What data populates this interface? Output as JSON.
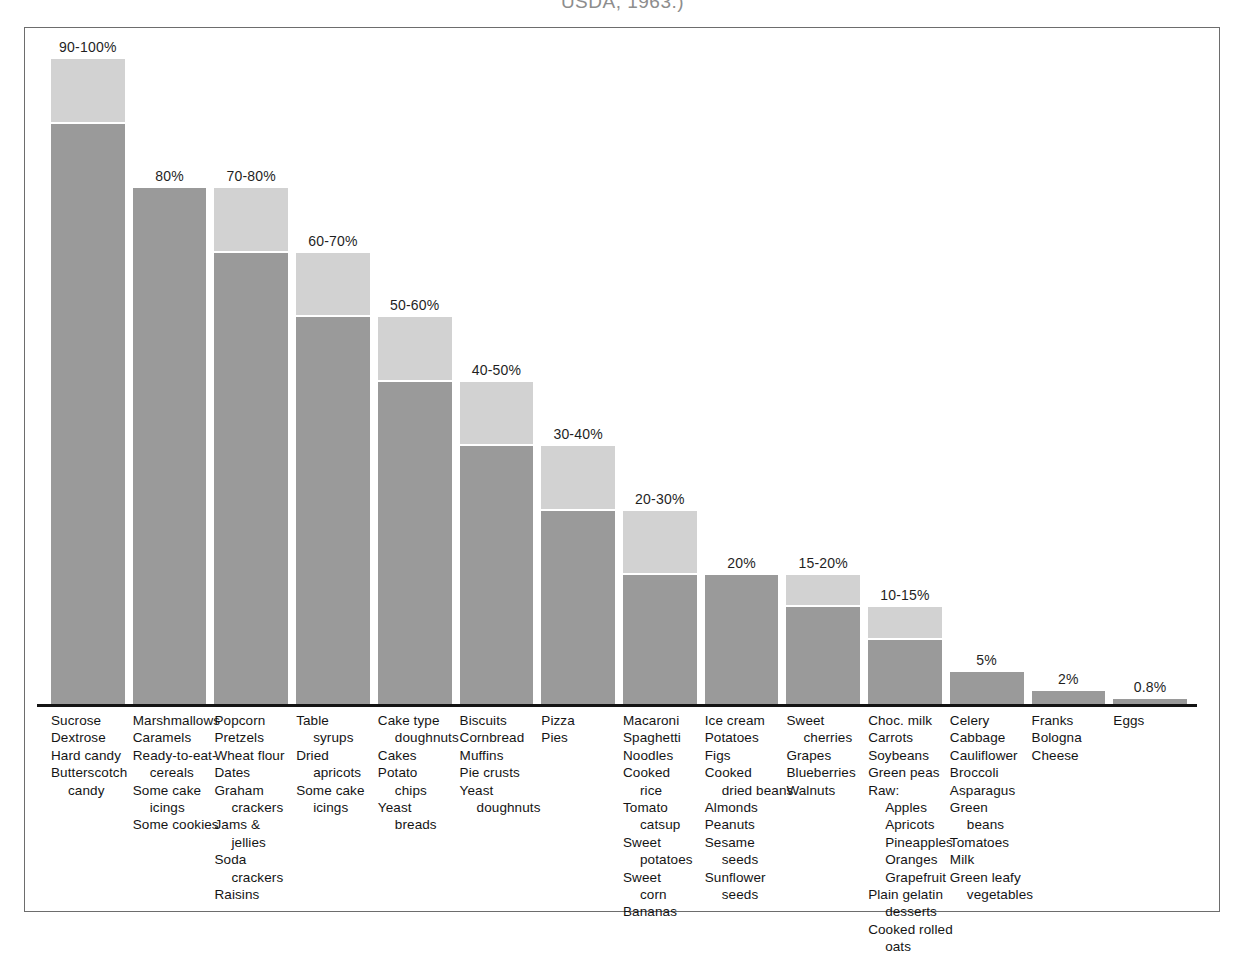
{
  "caption_clipped": "USDA, 1963.)",
  "colors": {
    "bar_low": "#9a9a9a",
    "bar_high": "#d2d2d2",
    "baseline": "#141414",
    "frame": "#6d6d6d",
    "background": "#ffffff",
    "text": "#141414"
  },
  "chart_data": {
    "type": "bar",
    "title": "",
    "subtitle": "",
    "xlabel": "",
    "ylabel": "",
    "ylim": [
      0,
      100
    ],
    "grid": false,
    "legend": "none",
    "note": "Percent of sugar (sucrose and other sugars) by weight in common foods. Bars with a range show a dark lower segment up to the low value and a light cap up to the high value; single-value bars are solid dark.",
    "categories": [
      "Sucrose group",
      "Marshmallows group",
      "Popcorn group",
      "Table syrups group",
      "Cake type doughnuts group",
      "Biscuits group",
      "Pizza group",
      "Macaroni group",
      "Ice cream group",
      "Sweet cherries group",
      "Choc. milk group",
      "Celery group",
      "Franks group",
      "Eggs group"
    ],
    "values": [
      100,
      80,
      80,
      70,
      60,
      50,
      40,
      30,
      20,
      20,
      15,
      5,
      2,
      0.8
    ],
    "low_values": [
      90,
      80,
      70,
      60,
      50,
      40,
      30,
      20,
      20,
      15,
      10,
      5,
      2,
      0.8
    ],
    "high_values": [
      100,
      80,
      80,
      70,
      60,
      50,
      40,
      30,
      20,
      20,
      15,
      5,
      2,
      0.8
    ],
    "value_labels": [
      "90-100%",
      "80%",
      "70-80%",
      "60-70%",
      "50-60%",
      "40-50%",
      "30-40%",
      "20-30%",
      "20%",
      "15-20%",
      "10-15%",
      "5%",
      "2%",
      "0.8%"
    ]
  },
  "bars": [
    {
      "label": "90-100%",
      "low": 90,
      "high": 100,
      "foods": [
        {
          "text": "Sucrose",
          "indent": 0
        },
        {
          "text": "Dextrose",
          "indent": 0
        },
        {
          "text": "Hard candy",
          "indent": 0
        },
        {
          "text": "Butterscotch",
          "indent": 0
        },
        {
          "text": "candy",
          "indent": 1
        }
      ]
    },
    {
      "label": "80%",
      "low": 80,
      "high": 80,
      "foods": [
        {
          "text": "Marshmallows",
          "indent": 0
        },
        {
          "text": "Caramels",
          "indent": 0
        },
        {
          "text": "Ready-to-eat-",
          "indent": 0
        },
        {
          "text": "cereals",
          "indent": 1
        },
        {
          "text": "Some cake",
          "indent": 0
        },
        {
          "text": "icings",
          "indent": 1
        },
        {
          "text": "Some cookies",
          "indent": 0
        }
      ]
    },
    {
      "label": "70-80%",
      "low": 70,
      "high": 80,
      "foods": [
        {
          "text": "Popcorn",
          "indent": 0
        },
        {
          "text": "Pretzels",
          "indent": 0
        },
        {
          "text": "Wheat flour",
          "indent": 0
        },
        {
          "text": "Dates",
          "indent": 0
        },
        {
          "text": "Graham",
          "indent": 0
        },
        {
          "text": "crackers",
          "indent": 1
        },
        {
          "text": "Jams &",
          "indent": 0
        },
        {
          "text": "jellies",
          "indent": 1
        },
        {
          "text": "Soda",
          "indent": 0
        },
        {
          "text": "crackers",
          "indent": 1
        },
        {
          "text": "Raisins",
          "indent": 0
        }
      ]
    },
    {
      "label": "60-70%",
      "low": 60,
      "high": 70,
      "foods": [
        {
          "text": "Table",
          "indent": 0
        },
        {
          "text": "syrups",
          "indent": 1
        },
        {
          "text": "Dried",
          "indent": 0
        },
        {
          "text": "apricots",
          "indent": 1
        },
        {
          "text": "Some cake",
          "indent": 0
        },
        {
          "text": "icings",
          "indent": 1
        }
      ]
    },
    {
      "label": "50-60%",
      "low": 50,
      "high": 60,
      "foods": [
        {
          "text": "Cake type",
          "indent": 0
        },
        {
          "text": "doughnuts",
          "indent": 1
        },
        {
          "text": "Cakes",
          "indent": 0
        },
        {
          "text": "Potato",
          "indent": 0
        },
        {
          "text": "chips",
          "indent": 1
        },
        {
          "text": "Yeast",
          "indent": 0
        },
        {
          "text": "breads",
          "indent": 1
        }
      ]
    },
    {
      "label": "40-50%",
      "low": 40,
      "high": 50,
      "foods": [
        {
          "text": "Biscuits",
          "indent": 0
        },
        {
          "text": "Cornbread",
          "indent": 0
        },
        {
          "text": "Muffins",
          "indent": 0
        },
        {
          "text": "Pie crusts",
          "indent": 0
        },
        {
          "text": "Yeast",
          "indent": 0
        },
        {
          "text": "doughnuts",
          "indent": 1
        }
      ]
    },
    {
      "label": "30-40%",
      "low": 30,
      "high": 40,
      "foods": [
        {
          "text": "Pizza",
          "indent": 0
        },
        {
          "text": "Pies",
          "indent": 0
        }
      ]
    },
    {
      "label": "20-30%",
      "low": 20,
      "high": 30,
      "foods": [
        {
          "text": "Macaroni",
          "indent": 0
        },
        {
          "text": "Spaghetti",
          "indent": 0
        },
        {
          "text": "Noodles",
          "indent": 0
        },
        {
          "text": "Cooked",
          "indent": 0
        },
        {
          "text": "rice",
          "indent": 1
        },
        {
          "text": "Tomato",
          "indent": 0
        },
        {
          "text": "catsup",
          "indent": 1
        },
        {
          "text": "Sweet",
          "indent": 0
        },
        {
          "text": "potatoes",
          "indent": 1
        },
        {
          "text": "Sweet",
          "indent": 0
        },
        {
          "text": "corn",
          "indent": 1
        },
        {
          "text": "Bananas",
          "indent": 0
        }
      ]
    },
    {
      "label": "20%",
      "low": 20,
      "high": 20,
      "foods": [
        {
          "text": "Ice cream",
          "indent": 0
        },
        {
          "text": "Potatoes",
          "indent": 0
        },
        {
          "text": "Figs",
          "indent": 0
        },
        {
          "text": "Cooked",
          "indent": 0
        },
        {
          "text": "dried beans",
          "indent": 1
        },
        {
          "text": "Almonds",
          "indent": 0
        },
        {
          "text": "Peanuts",
          "indent": 0
        },
        {
          "text": "Sesame",
          "indent": 0
        },
        {
          "text": "seeds",
          "indent": 1
        },
        {
          "text": "Sunflower",
          "indent": 0
        },
        {
          "text": "seeds",
          "indent": 1
        }
      ]
    },
    {
      "label": "15-20%",
      "low": 15,
      "high": 20,
      "foods": [
        {
          "text": "Sweet",
          "indent": 0
        },
        {
          "text": "cherries",
          "indent": 1
        },
        {
          "text": "Grapes",
          "indent": 0
        },
        {
          "text": "Blueberries",
          "indent": 0
        },
        {
          "text": "Walnuts",
          "indent": 0
        }
      ]
    },
    {
      "label": "10-15%",
      "low": 10,
      "high": 15,
      "foods": [
        {
          "text": "Choc. milk",
          "indent": 0
        },
        {
          "text": "Carrots",
          "indent": 0
        },
        {
          "text": "Soybeans",
          "indent": 0
        },
        {
          "text": "Green peas",
          "indent": 0
        },
        {
          "text": "Raw:",
          "indent": 0
        },
        {
          "text": "Apples",
          "indent": 1
        },
        {
          "text": "Apricots",
          "indent": 1
        },
        {
          "text": "Pineapples",
          "indent": 1
        },
        {
          "text": "Oranges",
          "indent": 1
        },
        {
          "text": "Grapefruit",
          "indent": 1
        },
        {
          "text": "Plain gelatin",
          "indent": 0
        },
        {
          "text": "desserts",
          "indent": 1
        },
        {
          "text": "Cooked rolled",
          "indent": 0
        },
        {
          "text": "oats",
          "indent": 1
        }
      ]
    },
    {
      "label": "5%",
      "low": 5,
      "high": 5,
      "foods": [
        {
          "text": "Celery",
          "indent": 0
        },
        {
          "text": "Cabbage",
          "indent": 0
        },
        {
          "text": "Cauliflower",
          "indent": 0
        },
        {
          "text": "Broccoli",
          "indent": 0
        },
        {
          "text": "Asparagus",
          "indent": 0
        },
        {
          "text": "Green",
          "indent": 0
        },
        {
          "text": "beans",
          "indent": 1
        },
        {
          "text": "Tomatoes",
          "indent": 0
        },
        {
          "text": "Milk",
          "indent": 0
        },
        {
          "text": "Green leafy",
          "indent": 0
        },
        {
          "text": "vegetables",
          "indent": 1
        }
      ]
    },
    {
      "label": "2%",
      "low": 2,
      "high": 2,
      "foods": [
        {
          "text": "Franks",
          "indent": 0
        },
        {
          "text": "Bologna",
          "indent": 0
        },
        {
          "text": "Cheese",
          "indent": 0
        }
      ]
    },
    {
      "label": "0.8%",
      "low": 0.8,
      "high": 0.8,
      "foods": [
        {
          "text": "Eggs",
          "indent": 0
        }
      ]
    }
  ]
}
